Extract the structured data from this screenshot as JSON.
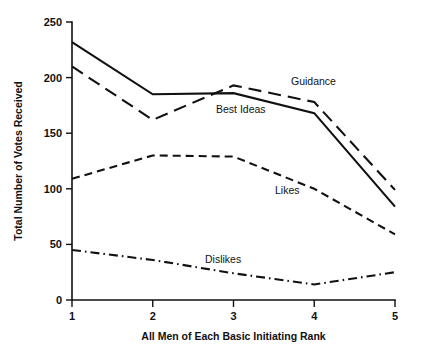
{
  "chart_data": {
    "type": "line",
    "title": "",
    "xlabel": "All Men of Each Basic Initiating Rank",
    "ylabel": "Total Number of Votes Received",
    "x": [
      1,
      2,
      3,
      4,
      5
    ],
    "xticklabels": [
      "1",
      "2",
      "3",
      "4",
      "5"
    ],
    "yticks": [
      0,
      50,
      100,
      150,
      200,
      250
    ],
    "yticklabels": [
      "0",
      "50",
      "100",
      "150",
      "200",
      "250"
    ],
    "xlim": [
      1,
      5
    ],
    "ylim": [
      0,
      250
    ],
    "grid": false,
    "legend_position": "inline-annotations",
    "series": [
      {
        "name": "Guidance",
        "values": [
          232,
          185,
          186,
          168,
          84
        ],
        "linestyle": "solid",
        "color": "#111111",
        "label_text": "Guidance",
        "label_x": 291,
        "label_y": 85
      },
      {
        "name": "Best Ideas",
        "values": [
          210,
          162,
          193,
          178,
          99
        ],
        "linestyle": "long-dash",
        "color": "#111111",
        "label_text": "Best Ideas",
        "label_x": 216,
        "label_y": 113
      },
      {
        "name": "Likes",
        "values": [
          109,
          130,
          129,
          100,
          59
        ],
        "linestyle": "short-dash",
        "color": "#111111",
        "label_text": "Likes",
        "label_x": 275,
        "label_y": 194
      },
      {
        "name": "Dislikes",
        "values": [
          45,
          36,
          24,
          14,
          25
        ],
        "linestyle": "dash-dot",
        "color": "#111111",
        "label_text": "Dislikes",
        "label_x": 205,
        "label_y": 263
      }
    ]
  },
  "axes": {
    "y_title": "Total Number of Votes Received",
    "x_title": "All Men of Each Basic Initiating Rank",
    "y_tick_0": "0",
    "y_tick_1": "50",
    "y_tick_2": "100",
    "y_tick_3": "150",
    "y_tick_4": "200",
    "y_tick_5": "250",
    "x_tick_0": "1",
    "x_tick_1": "2",
    "x_tick_2": "3",
    "x_tick_3": "4",
    "x_tick_4": "5"
  },
  "colors": {
    "ink": "#111111",
    "background": "#ffffff"
  }
}
